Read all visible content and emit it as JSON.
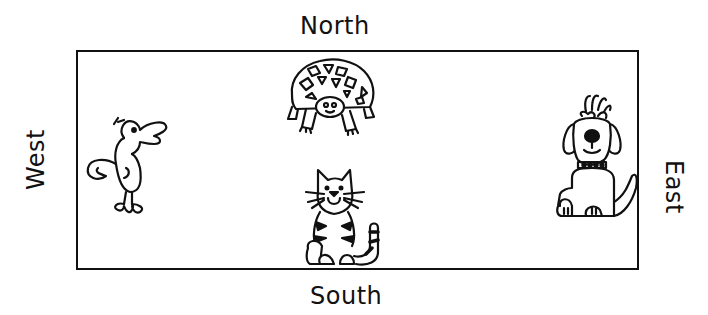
{
  "diagram": {
    "type": "compass-map",
    "directions": {
      "north": "North",
      "south": "South",
      "east": "East",
      "west": "West"
    },
    "animals": [
      {
        "name": "turtle",
        "position": "north"
      },
      {
        "name": "bird",
        "position": "west"
      },
      {
        "name": "dog",
        "position": "east"
      },
      {
        "name": "cat",
        "position": "south"
      }
    ],
    "colors": {
      "stroke": "#111111",
      "background": "#ffffff"
    }
  }
}
